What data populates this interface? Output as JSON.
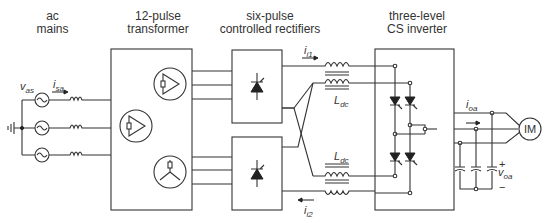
{
  "blocks": {
    "ac_mains": {
      "line1": "ac",
      "line2": "mains"
    },
    "transformer": {
      "line1": "12-pulse",
      "line2": "transformer"
    },
    "rectifiers": {
      "line1": "six-pulse",
      "line2": "controlled rectifiers"
    },
    "inverter": {
      "line1": "three-level",
      "line2": "CS inverter"
    },
    "motor": {
      "label": "IM"
    }
  },
  "symbols": {
    "v_as": {
      "main": "v",
      "sub": "as"
    },
    "i_sa": {
      "main": "i",
      "sub": "sa"
    },
    "i_i1": {
      "main": "i",
      "sub": "i1"
    },
    "i_i2": {
      "main": "i",
      "sub": "i2"
    },
    "L_dc_top": {
      "main": "L",
      "sub": "dc"
    },
    "L_dc_bottom": {
      "main": "L",
      "sub": "dc"
    },
    "i_oa": {
      "main": "i",
      "sub": "oa"
    },
    "v_oa": {
      "main": "v",
      "sub": "oa"
    },
    "plus": "+",
    "minus": "−"
  }
}
